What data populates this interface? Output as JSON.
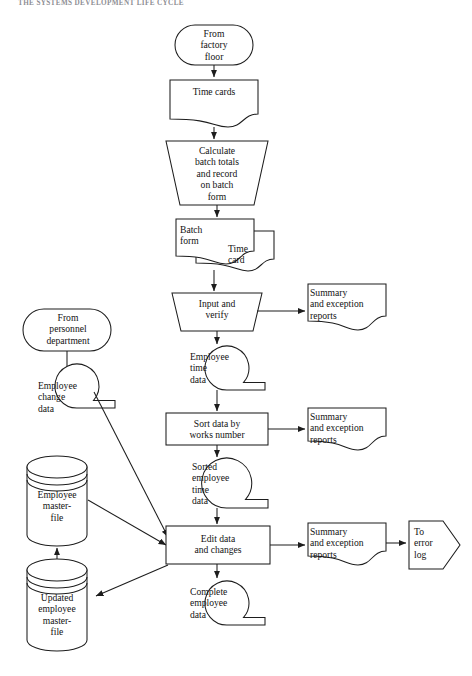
{
  "page": {
    "running_header": "THE SYSTEMS DEVELOPMENT LIFE CYCLE",
    "background_color": "#ffffff",
    "line_color": "#1d1d1d",
    "text_color": "#121212"
  },
  "diagram": {
    "nodes": {
      "from_factory_floor": {
        "label": "From\nfactory\nfloor",
        "shape": "terminator"
      },
      "time_cards": {
        "label": "Time cards",
        "shape": "document"
      },
      "calculate_batch": {
        "label": "Calculate\nbatch totals\nand record\non batch\nform",
        "shape": "manual-operation"
      },
      "batch_form": {
        "label": "Batch\nform",
        "shape": "document"
      },
      "time_card": {
        "label": "Time\ncard",
        "shape": "document"
      },
      "input_and_verify": {
        "label": "Input and\nverify",
        "shape": "manual-operation"
      },
      "summary_reports_1": {
        "label": "Summary\nand exception\nreports",
        "shape": "document"
      },
      "employee_time_data": {
        "label": "Employee\ntime\ndata",
        "shape": "magnetic-tape"
      },
      "from_personnel": {
        "label": "From\npersonnel\ndepartment",
        "shape": "terminator"
      },
      "employee_change_data": {
        "label": "Employee\nchange\ndata",
        "shape": "magnetic-tape"
      },
      "sort_data": {
        "label": "Sort data by\nworks number",
        "shape": "process"
      },
      "summary_reports_2": {
        "label": "Summary\nand exception\nreports",
        "shape": "document"
      },
      "sorted_time_data": {
        "label": "Sorted\nemployee\ntime\ndata",
        "shape": "magnetic-tape"
      },
      "employee_masterfile": {
        "label": "Employee\nmaster-\nfile",
        "shape": "disk-storage"
      },
      "updated_masterfile": {
        "label": "Updated\nemployee\nmaster-\nfile",
        "shape": "disk-storage"
      },
      "edit_data": {
        "label": "Edit data\nand changes",
        "shape": "process"
      },
      "summary_reports_3": {
        "label": "Summary\nand exception\nreports",
        "shape": "document"
      },
      "to_error_log": {
        "label": "To\nerror\nlog",
        "shape": "off-page-connector"
      },
      "complete_employee": {
        "label": "Complete\nemployee\ndata",
        "shape": "magnetic-tape"
      }
    },
    "edges": [
      {
        "from": "from_factory_floor",
        "to": "time_cards",
        "arrow": true
      },
      {
        "from": "time_cards",
        "to": "calculate_batch",
        "arrow": true
      },
      {
        "from": "calculate_batch",
        "to": "batch_form",
        "arrow": true
      },
      {
        "from": "batch_form",
        "to": "input_and_verify",
        "arrow": true
      },
      {
        "from": "input_and_verify",
        "to": "summary_reports_1",
        "arrow": true
      },
      {
        "from": "input_and_verify",
        "to": "employee_time_data",
        "arrow": true
      },
      {
        "from": "employee_time_data",
        "to": "sort_data",
        "arrow": true
      },
      {
        "from": "from_personnel",
        "to": "employee_change_data",
        "arrow": false
      },
      {
        "from": "sort_data",
        "to": "summary_reports_2",
        "arrow": true
      },
      {
        "from": "sort_data",
        "to": "sorted_time_data",
        "arrow": true
      },
      {
        "from": "sorted_time_data",
        "to": "edit_data",
        "arrow": true
      },
      {
        "from": "employee_change_data",
        "to": "edit_data",
        "arrow": true
      },
      {
        "from": "employee_masterfile",
        "to": "edit_data",
        "arrow": true
      },
      {
        "from": "edit_data",
        "to": "summary_reports_3",
        "arrow": true
      },
      {
        "from": "summary_reports_3",
        "to": "to_error_log",
        "arrow": true
      },
      {
        "from": "edit_data",
        "to": "complete_employee",
        "arrow": true
      },
      {
        "from": "edit_data",
        "to": "updated_masterfile",
        "arrow": true
      },
      {
        "from": "updated_masterfile",
        "to": "employee_masterfile",
        "arrow": true
      }
    ]
  }
}
